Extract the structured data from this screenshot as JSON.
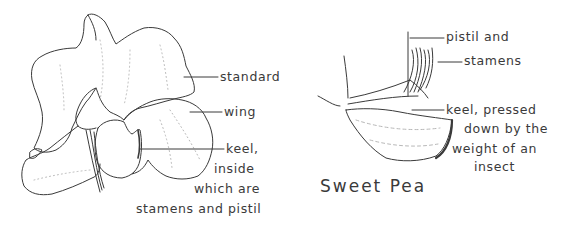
{
  "figure": {
    "left_flower": {
      "labels": {
        "standard": "standard",
        "wing": "wing",
        "keel_line1": "keel,",
        "keel_line2": "inside",
        "keel_line3": "which are",
        "keel_line4": "stamens and pistil"
      }
    },
    "right_flower": {
      "title": "Sweet Pea",
      "labels": {
        "pistil_and": "pistil and",
        "stamens": "stamens",
        "keel_line1": "keel, pressed",
        "keel_line2": "down by the",
        "keel_line3": "weight of an",
        "keel_line4": "insect"
      }
    },
    "colors": {
      "ink": "#3a3a3a",
      "shading": "#b8b8b8",
      "background": "#ffffff"
    }
  }
}
